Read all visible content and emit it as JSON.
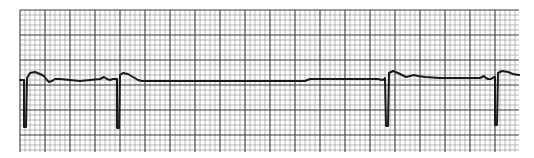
{
  "strip": {
    "paper_color": "#ffffff",
    "grid_minor_color": "#9a9a9a",
    "grid_major_color": "#3a3a3a",
    "trace_color": "#1a1a1a",
    "beats": [
      {
        "index": 1,
        "type": "QRS",
        "deflection": "negative",
        "followed_by": "ST elevation / T wave"
      },
      {
        "index": 2,
        "type": "QRS",
        "deflection": "negative",
        "followed_by": "long pause"
      },
      {
        "index": 3,
        "type": "QRS",
        "deflection": "negative",
        "followed_by": "ST elevation / T wave"
      },
      {
        "index": 4,
        "type": "QRS",
        "deflection": "negative",
        "followed_by": "ST elevation"
      }
    ],
    "notes": "Predominantly negative QRS complexes with a prolonged pause between beats 2 and 3"
  }
}
